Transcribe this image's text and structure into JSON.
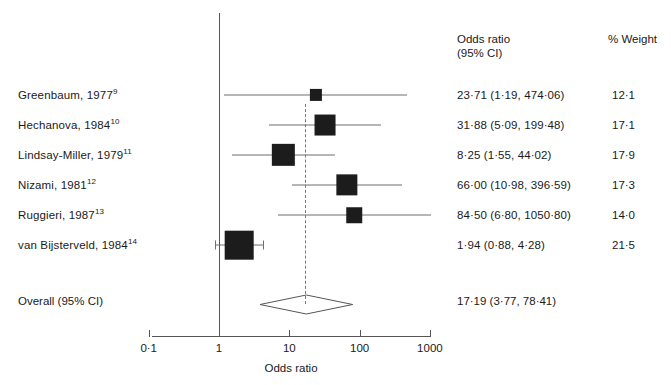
{
  "chart_data": {
    "type": "forest",
    "title": "",
    "xlabel": "Odds ratio",
    "ylabel": "",
    "scale": "log",
    "xlim": [
      0.1,
      1000
    ],
    "ticks": [
      "0·1",
      "1",
      "10",
      "100",
      "1000"
    ],
    "tick_values": [
      0.1,
      1,
      10,
      100,
      1000
    ],
    "null_value": 1,
    "grid": false,
    "columns": {
      "or_header_line1": "Odds ratio",
      "or_header_line2": "(95% CI)",
      "weight_header": "% Weight"
    },
    "studies": [
      {
        "label": "Greenbaum, 1977",
        "ref": "9",
        "or": 23.71,
        "ci_low": 1.19,
        "ci_high": 474.06,
        "or_text": "23·71 (1·19, 474·06)",
        "weight": 12.1,
        "weight_text": "12·1"
      },
      {
        "label": "Hechanova, 1984",
        "ref": "10",
        "or": 31.88,
        "ci_low": 5.09,
        "ci_high": 199.48,
        "or_text": "31·88 (5·09, 199·48)",
        "weight": 17.1,
        "weight_text": "17·1"
      },
      {
        "label": "Lindsay-Miller, 1979",
        "ref": "11",
        "or": 8.25,
        "ci_low": 1.55,
        "ci_high": 44.02,
        "or_text": "8·25 (1·55, 44·02)",
        "weight": 17.9,
        "weight_text": "17·9"
      },
      {
        "label": "Nizami, 1981",
        "ref": "12",
        "or": 66.0,
        "ci_low": 10.98,
        "ci_high": 396.59,
        "or_text": "66·00 (10·98, 396·59)",
        "weight": 17.3,
        "weight_text": "17·3"
      },
      {
        "label": "Ruggieri, 1987",
        "ref": "13",
        "or": 84.5,
        "ci_low": 6.8,
        "ci_high": 1050.8,
        "or_text": "84·50 (6·80, 1050·80)",
        "weight": 14.0,
        "weight_text": "14·0"
      },
      {
        "label": "van Bijsterveld, 1984",
        "ref": "14",
        "or": 1.94,
        "ci_low": 0.88,
        "ci_high": 4.28,
        "or_text": "1·94 (0·88, 4·28)",
        "weight": 21.5,
        "weight_text": "21·5"
      }
    ],
    "overall": {
      "label": "Overall (95% CI)",
      "or": 17.19,
      "ci_low": 3.77,
      "ci_high": 78.41,
      "or_text": "17·19 (3·77, 78·41)"
    },
    "colors": {
      "marker": "#1c1c1c",
      "line": "#6f6f6f",
      "axis": "#555555",
      "text": "#1a1a1a"
    }
  }
}
